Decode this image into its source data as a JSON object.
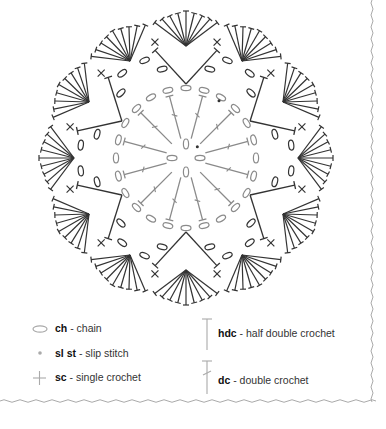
{
  "diagram": {
    "center": [
      186,
      158
    ],
    "petal_count": 12,
    "outer_radius": 147,
    "colors": {
      "outer_rounds": "#333333",
      "inner_rounds": "#8a8a8a",
      "border": "#aaaaaa",
      "slip_stitch": "#333333"
    }
  },
  "legend": {
    "items": [
      {
        "symbol": "chain-icon",
        "abbr": "ch",
        "sep": " - ",
        "name": "chain"
      },
      {
        "symbol": "slip-stitch-icon",
        "abbr": "sl st",
        "sep": " - ",
        "name": "slip stitch"
      },
      {
        "symbol": "single-crochet-icon",
        "abbr": "sc",
        "sep": " - ",
        "name": "single crochet"
      },
      {
        "symbol": "half-double-crochet-icon",
        "abbr": "hdc",
        "sep": " - ",
        "name": "half double crochet"
      },
      {
        "symbol": "double-crochet-icon",
        "abbr": "dc",
        "sep": " - ",
        "name": "double crochet"
      }
    ]
  }
}
